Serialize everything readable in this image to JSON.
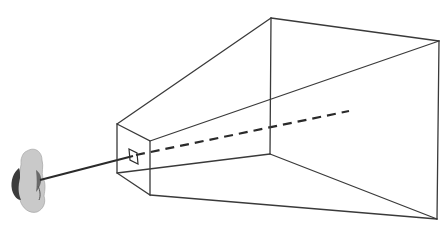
{
  "diagram": {
    "colors": {
      "edge": "#3a3a3a",
      "ray": "#2a2a2a",
      "head_light": "#c8c8c8",
      "head_dark": "#3c3c3c",
      "background": "#ffffff"
    },
    "near_plane": {
      "top_left": [
        117,
        124
      ],
      "top_right": [
        150,
        141
      ],
      "bottom_right": [
        150,
        195
      ],
      "bottom_left": [
        117,
        173
      ]
    },
    "far_plane": {
      "top_left": [
        271,
        18
      ],
      "top_right": [
        439,
        41
      ],
      "bottom_right": [
        437,
        219
      ],
      "bottom_left": [
        270,
        154
      ]
    },
    "image_window": [
      [
        129,
        149
      ],
      [
        137,
        153
      ],
      [
        138,
        164
      ],
      [
        130,
        160
      ]
    ],
    "sight_line": {
      "from": [
        40,
        180
      ],
      "to": [
        133,
        156
      ]
    },
    "dashed_line": {
      "from": [
        133,
        156
      ],
      "to": [
        349,
        111
      ]
    },
    "elements": [
      "observer-head",
      "line-of-sight",
      "near-clipping-plane",
      "image-window",
      "far-clipping-plane",
      "view-axis-dashed"
    ]
  }
}
